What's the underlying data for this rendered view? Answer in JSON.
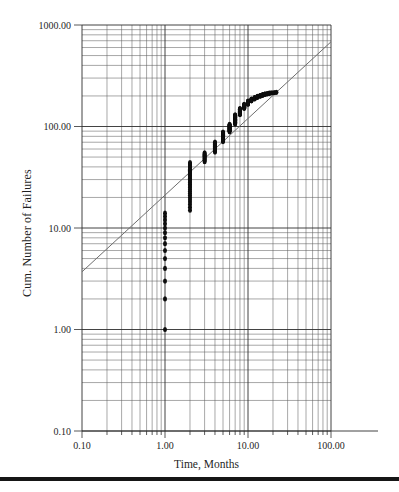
{
  "page": {
    "background": "#ffffff"
  },
  "chart_data": {
    "type": "scatter",
    "title": "",
    "xlabel": "Time, Months",
    "ylabel": "Cum. Number of Failures",
    "x_scale": "log",
    "y_scale": "log",
    "xlim": [
      0.1,
      100
    ],
    "ylim": [
      0.1,
      1000
    ],
    "grid": "full log-log graph paper, minor lines at 2-9 per decade",
    "legend": "none",
    "x_tick_labels": [
      {
        "value": 0.1,
        "label": "0.10"
      },
      {
        "value": 1,
        "label": "1.00"
      },
      {
        "value": 10,
        "label": "10.00"
      },
      {
        "value": 100,
        "label": "100.00"
      }
    ],
    "y_tick_labels": [
      {
        "value": 0.1,
        "label": "0.10"
      },
      {
        "value": 1,
        "label": "1.00"
      },
      {
        "value": 10,
        "label": "10.00"
      },
      {
        "value": 100,
        "label": "100.00"
      },
      {
        "value": 1000,
        "label": "1000.00"
      }
    ],
    "fit_line": {
      "x1": 0.1,
      "y1": 3.7,
      "x2": 100,
      "y2": 683
    },
    "series": [
      {
        "name": "Cumulative number of failures vs time",
        "marker": "filled-dot",
        "points_as_clusters": [
          {
            "time_months": 1,
            "cum_from": 1,
            "cum_to": 14
          },
          {
            "time_months": 2,
            "cum_from": 15,
            "cum_to": 44
          },
          {
            "time_months": 3,
            "cum_from": 45,
            "cum_to": 55
          },
          {
            "time_months": 4,
            "cum_from": 56,
            "cum_to": 70
          },
          {
            "time_months": 5,
            "cum_from": 71,
            "cum_to": 88
          },
          {
            "time_months": 6,
            "cum_from": 89,
            "cum_to": 105
          },
          {
            "time_months": 7,
            "cum_from": 106,
            "cum_to": 130
          },
          {
            "time_months": 8,
            "cum_from": 131,
            "cum_to": 150
          },
          {
            "time_months": 9,
            "cum_from": 151,
            "cum_to": 165
          },
          {
            "time_months": 10,
            "cum_from": 166,
            "cum_to": 178
          },
          {
            "time_months": 11,
            "cum_from": 179,
            "cum_to": 186
          },
          {
            "time_months": 12,
            "cum_from": 187,
            "cum_to": 193
          },
          {
            "time_months": 13,
            "cum_from": 194,
            "cum_to": 198
          },
          {
            "time_months": 14,
            "cum_from": 199,
            "cum_to": 202
          },
          {
            "time_months": 15,
            "cum_from": 203,
            "cum_to": 206
          },
          {
            "time_months": 16,
            "cum_from": 207,
            "cum_to": 209
          },
          {
            "time_months": 17,
            "cum_from": 210,
            "cum_to": 211
          },
          {
            "time_months": 18,
            "cum_from": 212,
            "cum_to": 213
          },
          {
            "time_months": 19,
            "cum_from": 214,
            "cum_to": 214
          },
          {
            "time_months": 20,
            "cum_from": 215,
            "cum_to": 215
          },
          {
            "time_months": 21,
            "cum_from": 216,
            "cum_to": 216
          },
          {
            "time_months": 22,
            "cum_from": 217,
            "cum_to": 217
          }
        ]
      }
    ],
    "colors": {
      "grid_minor": "#5f5f5f",
      "grid_major": "#2e2e2e",
      "fit_line": "#6e6e6e",
      "points": "#0d0d0d",
      "text": "#1f1f1f",
      "page_rule": "#161616"
    }
  }
}
